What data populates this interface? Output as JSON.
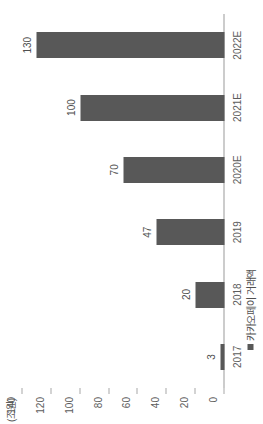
{
  "chart_data": {
    "type": "bar",
    "title": "",
    "subtitle": "",
    "unit_label": "(조원)",
    "xlabel": "",
    "ylabel": "",
    "categories": [
      "2017",
      "2018",
      "2019",
      "2020E",
      "2021E",
      "2022E"
    ],
    "values": [
      3,
      20,
      47,
      70,
      100,
      130
    ],
    "data_labels": [
      "3",
      "20",
      "47",
      "70",
      "100",
      "130"
    ],
    "ylim": [
      0,
      140
    ],
    "yticks": [
      0,
      20,
      40,
      60,
      80,
      100,
      120,
      140
    ],
    "ytick_labels": [
      "0",
      "20",
      "40",
      "60",
      "80",
      "100",
      "120",
      "140"
    ],
    "grid": false,
    "orientation": "vertical-bars-image-rotated-90ccw",
    "legend": {
      "position": "bottom-left",
      "entries": [
        {
          "label": "카카오페이 거래액",
          "color": "#585858"
        }
      ]
    },
    "colors": {
      "bar": "#585858",
      "axis": "#9a9a9a",
      "tick": "#a8a8a8",
      "text": "#5c5c5c",
      "background": "#ffffff"
    }
  }
}
